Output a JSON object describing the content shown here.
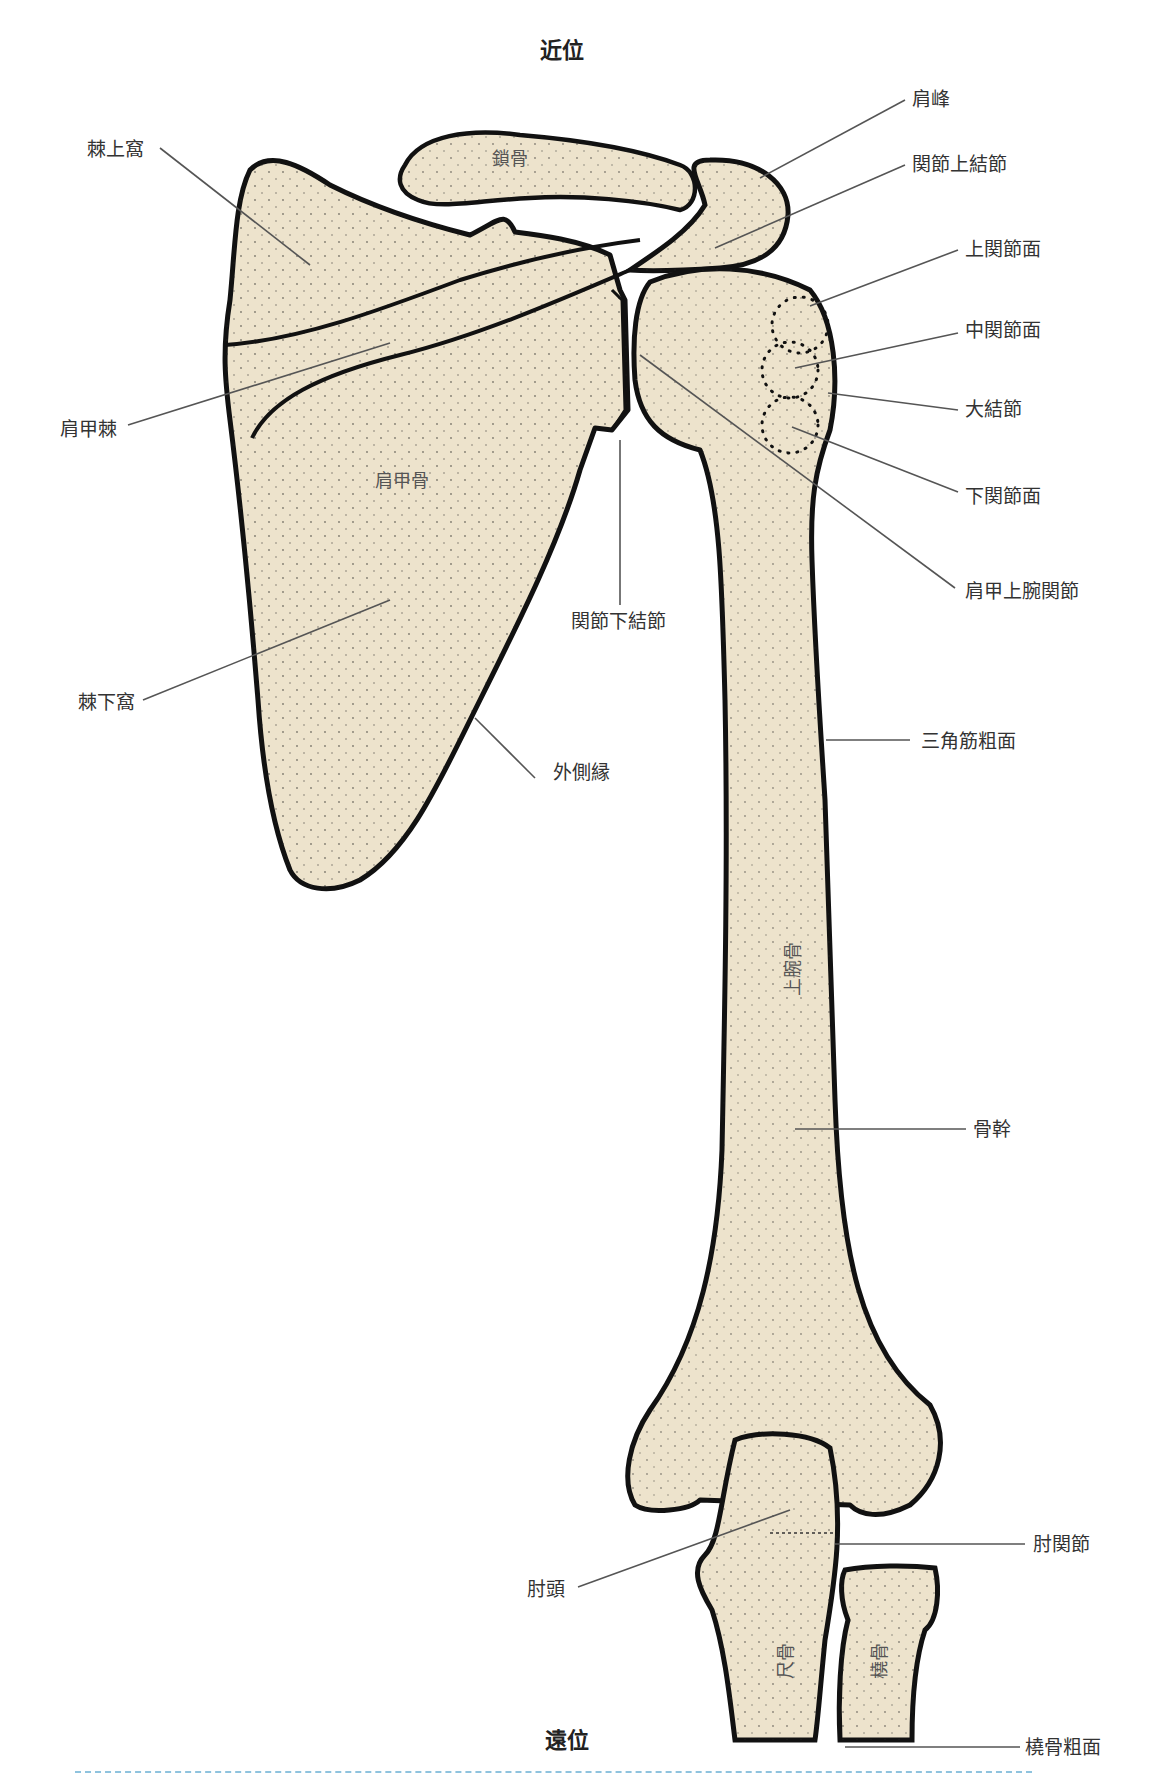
{
  "figure": {
    "type": "anatomical-illustration",
    "colors": {
      "bone_fill": "#EDE3CC",
      "outline": "#111111",
      "leader_line": "#555555",
      "label_text": "#333333",
      "divider": "#8FC3DE",
      "background": "#FFFFFF"
    }
  },
  "orientation": {
    "top": "近位",
    "bottom": "遠位"
  },
  "bone_names": {
    "clavicle": "鎖骨",
    "scapula": "肩甲骨",
    "humerus": "上腕骨",
    "ulna": "尺骨",
    "radius": "橈骨"
  },
  "labels": {
    "left": [
      {
        "id": "supraspinous_fossa",
        "text": "棘上窩"
      },
      {
        "id": "scapular_spine",
        "text": "肩甲棘"
      },
      {
        "id": "infraspinous_fossa",
        "text": "棘下窩"
      },
      {
        "id": "olecranon",
        "text": "肘頭"
      }
    ],
    "center": [
      {
        "id": "infraglenoid_tubercle",
        "text": "関節下結節"
      },
      {
        "id": "lateral_border",
        "text": "外側縁"
      }
    ],
    "right": [
      {
        "id": "acromion",
        "text": "肩峰"
      },
      {
        "id": "supraglenoid_tubercle",
        "text": "関節上結節"
      },
      {
        "id": "superior_facet",
        "text": "上関節面"
      },
      {
        "id": "middle_facet",
        "text": "中関節面"
      },
      {
        "id": "greater_tubercle",
        "text": "大結節"
      },
      {
        "id": "inferior_facet",
        "text": "下関節面"
      },
      {
        "id": "glenohumeral_joint",
        "text": "肩甲上腕関節"
      },
      {
        "id": "deltoid_tuberosity",
        "text": "三角筋粗面"
      },
      {
        "id": "shaft",
        "text": "骨幹"
      },
      {
        "id": "elbow_joint",
        "text": "肘関節"
      },
      {
        "id": "radial_tuberosity",
        "text": "橈骨粗面"
      }
    ]
  }
}
